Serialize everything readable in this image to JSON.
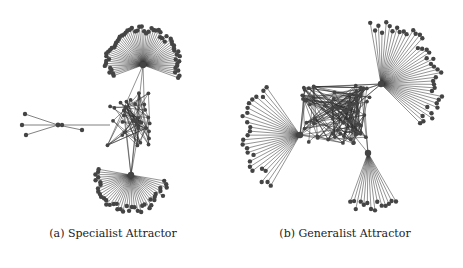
{
  "figure": {
    "panels": [
      {
        "id": "a",
        "caption": "(a) Specialist Attractor",
        "hubs": [
          {
            "x": 143,
            "y": 65,
            "spokes": 60,
            "r": 38,
            "start": -200,
            "end": 20
          },
          {
            "x": 131,
            "y": 175,
            "spokes": 40,
            "r": 38,
            "start": 10,
            "end": 190
          }
        ],
        "side_cluster": {
          "x": 58,
          "y": 125,
          "leaves": [
            [
              25,
              114
            ],
            [
              22,
              125
            ],
            [
              26,
              135
            ]
          ],
          "link": [
            [
              82,
              130
            ],
            [
              110,
              125
            ]
          ]
        },
        "core": {
          "x": 130,
          "y": 120,
          "w": 45,
          "h": 60,
          "nodes": 35,
          "edges": 90
        }
      },
      {
        "id": "b",
        "caption": "(b) Generalist Attractor",
        "hubs": [
          {
            "x": 381,
            "y": 84,
            "spokes": 40,
            "r": 62,
            "start": -100,
            "end": 45
          },
          {
            "x": 300,
            "y": 135,
            "spokes": 26,
            "r": 60,
            "start": 120,
            "end": 235
          },
          {
            "x": 368,
            "y": 153,
            "spokes": 14,
            "r": 58,
            "start": 60,
            "end": 110
          }
        ],
        "core": {
          "x": 335,
          "y": 115,
          "w": 70,
          "h": 60,
          "nodes": 70,
          "edges": 220
        }
      }
    ],
    "colors": {
      "edge": "#2b2b2b",
      "node": "#444444",
      "caption": "#222222"
    }
  }
}
